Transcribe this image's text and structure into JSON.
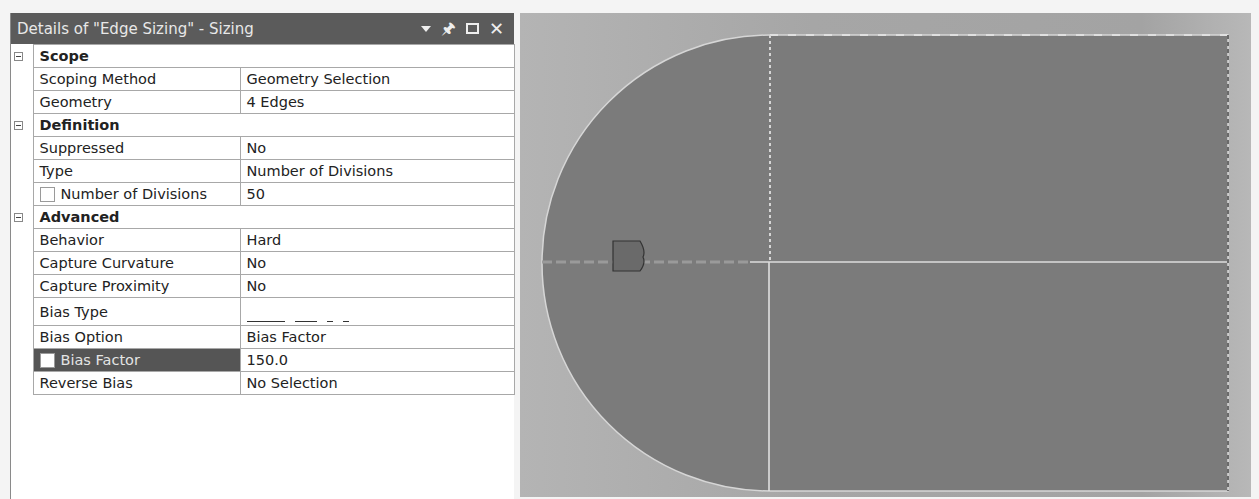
{
  "panel": {
    "title": "Details of \"Edge Sizing\" - Sizing",
    "icons": [
      "dropdown-icon",
      "pin-icon",
      "maximize-icon",
      "close-icon"
    ],
    "sections": [
      {
        "label": "Scope",
        "rows": [
          {
            "key": "Scoping Method",
            "value": "Geometry Selection"
          },
          {
            "key": "Geometry",
            "value": "4 Edges"
          }
        ]
      },
      {
        "label": "Definition",
        "rows": [
          {
            "key": "Suppressed",
            "value": "No"
          },
          {
            "key": "Type",
            "value": "Number of Divisions"
          },
          {
            "key": "Number of Divisions",
            "value": "50",
            "checkbox": true
          }
        ]
      },
      {
        "label": "Advanced",
        "rows": [
          {
            "key": "Behavior",
            "value": "Hard"
          },
          {
            "key": "Capture Curvature",
            "value": "No"
          },
          {
            "key": "Capture Proximity",
            "value": "No"
          },
          {
            "key": "Bias Type",
            "value": "bias-type-decreasing-dashes-icon"
          },
          {
            "key": "Bias Option",
            "value": "Bias Factor"
          },
          {
            "key": "Bias Factor",
            "value": "150.0",
            "checkbox": true,
            "selected": true
          },
          {
            "key": "Reverse Bias",
            "value": "No Selection"
          }
        ]
      }
    ]
  },
  "viewport": {
    "background_color": "#a8a8a8",
    "body_color": "#7b7b7b",
    "edge_color": "#d8d8d8",
    "marker_color": "#6a6a6a"
  }
}
